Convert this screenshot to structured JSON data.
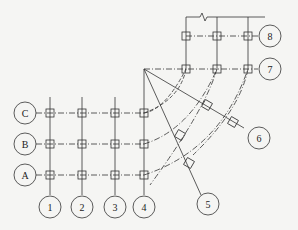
{
  "diagram": {
    "type": "structural-axis-grid",
    "colors": {
      "line": "#333333",
      "background": "#f5f5f3"
    },
    "center_point": [
      144,
      69
    ],
    "row_axes": [
      {
        "label": "C",
        "y": 113
      },
      {
        "label": "B",
        "y": 144
      },
      {
        "label": "A",
        "y": 175
      }
    ],
    "column_axes": [
      {
        "label": "1",
        "x": 50
      },
      {
        "label": "2",
        "x": 82
      },
      {
        "label": "3",
        "x": 115
      },
      {
        "label": "4",
        "x": 144
      }
    ],
    "upper_rows": [
      {
        "label": "8",
        "y": 36
      },
      {
        "label": "7",
        "y": 69
      }
    ],
    "upper_columns": [
      186,
      217,
      248
    ],
    "radial_axes": [
      {
        "label": "5"
      },
      {
        "label": "6"
      }
    ]
  }
}
